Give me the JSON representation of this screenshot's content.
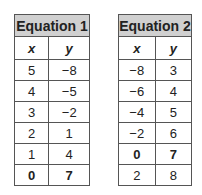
{
  "tables": [
    {
      "title": "Equation 1",
      "headers": [
        "x",
        "y"
      ],
      "rows": [
        {
          "x": "5",
          "y": "−8",
          "bold": false
        },
        {
          "x": "4",
          "y": "−5",
          "bold": false
        },
        {
          "x": "3",
          "y": "−2",
          "bold": false
        },
        {
          "x": "2",
          "y": "1",
          "bold": false
        },
        {
          "x": "1",
          "y": "4",
          "bold": false
        },
        {
          "x": "0",
          "y": "7",
          "bold": true
        }
      ]
    },
    {
      "title": "Equation 2",
      "headers": [
        "x",
        "y"
      ],
      "rows": [
        {
          "x": "−8",
          "y": "3",
          "bold": false
        },
        {
          "x": "−6",
          "y": "4",
          "bold": false
        },
        {
          "x": "−4",
          "y": "5",
          "bold": false
        },
        {
          "x": "−2",
          "y": "6",
          "bold": false
        },
        {
          "x": "0",
          "y": "7",
          "bold": true
        },
        {
          "x": "2",
          "y": "8",
          "bold": false
        }
      ]
    }
  ]
}
